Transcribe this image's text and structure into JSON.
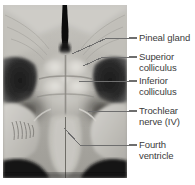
{
  "figure": {
    "type": "anatomical-photograph",
    "modality": "grayscale cadaveric specimen photograph",
    "photo_rect": {
      "x": 3,
      "y": 5,
      "width": 124,
      "height": 173
    },
    "background_color": "#ffffff",
    "leader_color": "#6e6e6e",
    "text_color": "#3b3b3b"
  },
  "labels": [
    {
      "id": "pineal-gland",
      "lines": [
        "Pineal gland"
      ],
      "dash": {
        "x1": 129,
        "y1": 38,
        "x2": 137,
        "y2": 38
      },
      "leader": [
        [
          129,
          38
        ],
        [
          107,
          38
        ],
        [
          72,
          54
        ]
      ],
      "text": {
        "x": 139,
        "y": 33
      }
    },
    {
      "id": "superior-colliculus",
      "lines": [
        "Superior",
        "colliculus"
      ],
      "dash": {
        "x1": 129,
        "y1": 57,
        "x2": 137,
        "y2": 57
      },
      "leader": [
        [
          129,
          57
        ],
        [
          103,
          57
        ],
        [
          83,
          66
        ]
      ],
      "text": {
        "x": 139,
        "y": 52
      }
    },
    {
      "id": "inferior-colliculus",
      "lines": [
        "Inferior",
        "colliculus"
      ],
      "dash": {
        "x1": 129,
        "y1": 81,
        "x2": 137,
        "y2": 81
      },
      "leader": [
        [
          129,
          81
        ],
        [
          79,
          81
        ]
      ],
      "text": {
        "x": 139,
        "y": 76
      }
    },
    {
      "id": "trochlear-nerve",
      "lines": [
        "Trochlear",
        "nerve (IV)"
      ],
      "dash": {
        "x1": 129,
        "y1": 111,
        "x2": 137,
        "y2": 111
      },
      "leader": [
        [
          129,
          111
        ],
        [
          88,
          111
        ]
      ],
      "text": {
        "x": 139,
        "y": 106
      }
    },
    {
      "id": "fourth-ventricle",
      "lines": [
        "Fourth",
        "ventricle"
      ],
      "dash": {
        "x1": 129,
        "y1": 145,
        "x2": 137,
        "y2": 145
      },
      "leader": [
        [
          129,
          145
        ],
        [
          80,
          145
        ],
        [
          64,
          128
        ]
      ],
      "text": {
        "x": 139,
        "y": 140
      }
    }
  ]
}
